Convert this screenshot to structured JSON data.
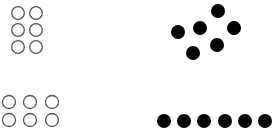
{
  "groups": [
    {
      "id": "top-left",
      "style": "open",
      "arrangement": "grid-2-columns-3-rows",
      "count": 6,
      "color": "#555555"
    },
    {
      "id": "top-right",
      "style": "filled",
      "arrangement": "scattered",
      "count": 6,
      "color": "#000000"
    },
    {
      "id": "bottom-left",
      "style": "open",
      "arrangement": "grid-3-columns-2-rows",
      "count": 6,
      "color": "#555555"
    },
    {
      "id": "bottom-right",
      "style": "filled",
      "arrangement": "single-row",
      "count": 6,
      "color": "#000000"
    }
  ]
}
